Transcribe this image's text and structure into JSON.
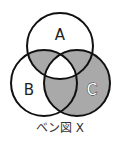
{
  "diagram": {
    "type": "venn",
    "caption": "ベン図 X",
    "sets": [
      {
        "id": "A",
        "label": "A"
      },
      {
        "id": "B",
        "label": "B"
      },
      {
        "id": "C",
        "label": "C"
      }
    ],
    "shaded_color": "#a9a9a9",
    "outline_color": "#111111",
    "shaded_regions": [
      "A∩B only",
      "A∩C only",
      "B∩C only",
      "C only"
    ],
    "unshaded_regions": [
      "A only",
      "B only",
      "A∩B∩C"
    ]
  }
}
